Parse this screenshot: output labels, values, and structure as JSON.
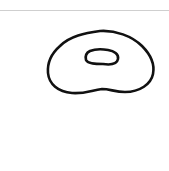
{
  "canvas": {
    "background": "#ffffff",
    "divider_color": "#cfcfcf",
    "stroke_color": "#111111",
    "stroke_width": 2.6,
    "shapes": [
      {
        "name": "donut-outer-ring",
        "type": "freehand-closed-path"
      },
      {
        "name": "donut-inner-hole",
        "type": "freehand-closed-path"
      }
    ]
  }
}
